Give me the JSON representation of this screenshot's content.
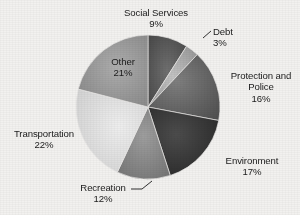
{
  "chart_data": {
    "type": "pie",
    "title": "",
    "subtitle": "",
    "xlabel": "",
    "ylabel": "",
    "legend_position": "none",
    "grid": false,
    "labels_inside": [
      "Other"
    ],
    "units": "percent",
    "total": 100,
    "categories": [
      "Social Services",
      "Debt",
      "Protection and Police",
      "Environment",
      "Recreation",
      "Transportation",
      "Other"
    ],
    "values": [
      9,
      3,
      16,
      17,
      12,
      22,
      21
    ],
    "start_angle_deg": 0,
    "direction": "clockwise",
    "slices": [
      {
        "name": "Social Services",
        "label_line1": "Social Services",
        "label_line2": "9%",
        "value": 9,
        "pct_text": "9%",
        "color": "#4c4c4c",
        "color_light": "#6f6f6f",
        "start_deg": 0.0,
        "end_deg": 32.4,
        "leader": false
      },
      {
        "name": "Debt",
        "label_line1": "Debt",
        "label_line2": "3%",
        "value": 3,
        "pct_text": "3%",
        "color": "#9a9a9a",
        "color_light": "#bcbcbc",
        "start_deg": 32.4,
        "end_deg": 43.2,
        "leader": true
      },
      {
        "name": "Protection and Police",
        "label_line1": "Protection and",
        "label_line2": "Police",
        "label_line3": "16%",
        "value": 16,
        "pct_text": "16%",
        "color": "#5a5a5a",
        "color_light": "#7d7d7d",
        "start_deg": 43.2,
        "end_deg": 100.8,
        "leader": false
      },
      {
        "name": "Environment",
        "label_line1": "Environment",
        "label_line2": "17%",
        "value": 17,
        "pct_text": "17%",
        "color": "#2e2e2e",
        "color_light": "#4a4a4a",
        "start_deg": 100.8,
        "end_deg": 162.0,
        "leader": false
      },
      {
        "name": "Recreation",
        "label_line1": "Recreation",
        "label_line2": "12%",
        "value": 12,
        "pct_text": "12%",
        "color": "#7b7b7b",
        "color_light": "#9c9c9c",
        "start_deg": 162.0,
        "end_deg": 205.2,
        "leader": true
      },
      {
        "name": "Transportation",
        "label_line1": "Transportation",
        "label_line2": "22%",
        "value": 22,
        "pct_text": "22%",
        "color": "#d8d8d8",
        "color_light": "#ebebeb",
        "start_deg": 205.2,
        "end_deg": 284.4,
        "leader": false
      },
      {
        "name": "Other",
        "label_line1": "Other",
        "label_line2": "21%",
        "value": 21,
        "pct_text": "21%",
        "color": "#8d8d8d",
        "color_light": "#ababab",
        "start_deg": 284.4,
        "end_deg": 360.0,
        "leader": false
      }
    ],
    "geometry": {
      "cx": 148,
      "cy": 107,
      "r": 72
    },
    "background_color": "#f2f1ef",
    "text_color": "#1b1b1b"
  },
  "labels": {
    "social_services": {
      "name": "Social Services",
      "pct": "9%"
    },
    "debt": {
      "name": "Debt",
      "pct": "3%"
    },
    "protection": {
      "name_line1": "Protection and",
      "name_line2": "Police",
      "pct": "16%"
    },
    "environment": {
      "name": "Environment",
      "pct": "17%"
    },
    "recreation": {
      "name": "Recreation",
      "pct": "12%"
    },
    "transportation": {
      "name": "Transportation",
      "pct": "22%"
    },
    "other": {
      "name": "Other",
      "pct": "21%"
    }
  }
}
